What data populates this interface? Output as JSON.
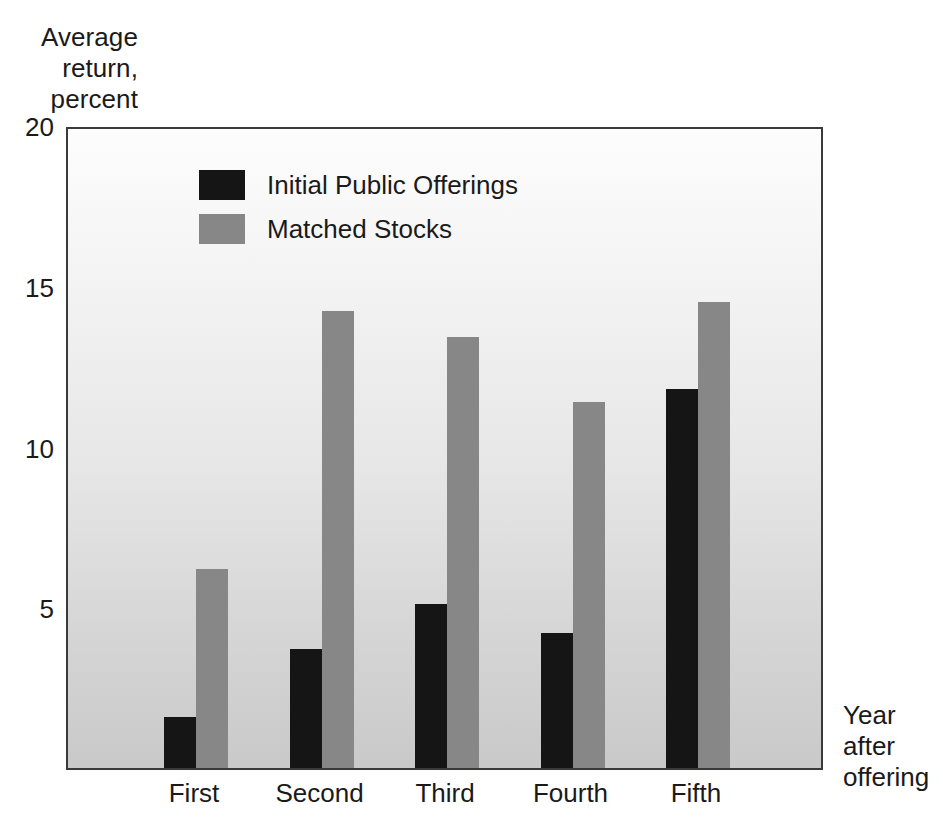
{
  "chart_data": {
    "type": "bar",
    "title": "",
    "subtitle": "",
    "ylabel": "Average\nreturn,\npercent",
    "xlabel": "Year\nafter\noffering",
    "categories": [
      "First",
      "Second",
      "Third",
      "Fourth",
      "Fifth"
    ],
    "series": [
      {
        "name": "Initial Public Offerings",
        "color": "#151515",
        "values": [
          1.6,
          3.7,
          5.1,
          4.2,
          11.8
        ]
      },
      {
        "name": "Matched Stocks",
        "color": "#878787",
        "values": [
          6.2,
          14.2,
          13.4,
          11.4,
          14.5
        ]
      }
    ],
    "ylim": [
      0,
      20
    ],
    "yticks": [
      0,
      5,
      10,
      15,
      20
    ],
    "ytick_labels": [
      "",
      "5",
      "10",
      "15",
      "20"
    ],
    "grid": false,
    "legend_position": "top-left-inside",
    "plot_background": "#e4e4e4",
    "frame_color": "#3a3a3a"
  },
  "axes": {
    "y_title": "Average\nreturn,\npercent",
    "x_title": "Year\nafter\noffering",
    "y_ticks": [
      {
        "label": "20",
        "value": 20
      },
      {
        "label": "15",
        "value": 15
      },
      {
        "label": "10",
        "value": 10
      },
      {
        "label": "5",
        "value": 5
      }
    ],
    "x_ticks": [
      "First",
      "Second",
      "Third",
      "Fourth",
      "Fifth"
    ]
  },
  "legend": {
    "items": [
      {
        "label": "Initial Public Offerings",
        "color": "#151515"
      },
      {
        "label": "Matched Stocks",
        "color": "#878787"
      }
    ]
  }
}
